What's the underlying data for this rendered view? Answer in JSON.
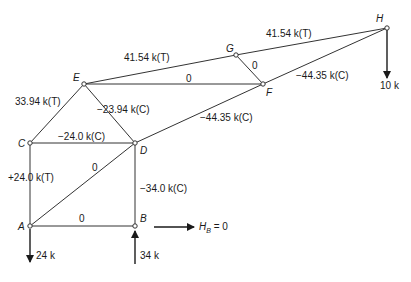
{
  "diagram": {
    "type": "truss-free-body",
    "nodes": {
      "A": {
        "label": "A",
        "x": 30,
        "y": 226
      },
      "B": {
        "label": "B",
        "x": 135,
        "y": 226
      },
      "C": {
        "label": "C",
        "x": 30,
        "y": 143
      },
      "D": {
        "label": "D",
        "x": 135,
        "y": 143
      },
      "E": {
        "label": "E",
        "x": 84,
        "y": 84
      },
      "F": {
        "label": "F",
        "x": 263,
        "y": 84
      },
      "G": {
        "label": "G",
        "x": 236,
        "y": 55
      },
      "H": {
        "label": "H",
        "x": 387,
        "y": 28
      }
    },
    "members": {
      "EG": {
        "force": "41.54 k(T)"
      },
      "GH": {
        "force": "41.54 k(T)"
      },
      "EF": {
        "force": "0"
      },
      "GF": {
        "force": "0"
      },
      "FH": {
        "force": "−44.35 k(C)"
      },
      "DF": {
        "force": "−44.35 k(C)"
      },
      "CE": {
        "force": "33.94 k(T)"
      },
      "ED": {
        "force": "−23.94 k(C)"
      },
      "CD": {
        "force": "−24.0 k(C)"
      },
      "AC": {
        "force": "+24.0 k(T)"
      },
      "AD": {
        "force": "0"
      },
      "BD": {
        "force": "−34.0 k(C)"
      },
      "AB": {
        "force": "0"
      }
    },
    "loads": {
      "H": {
        "label": "10 k",
        "direction": "down"
      },
      "A": {
        "label": "24 k",
        "direction": "down"
      },
      "B": {
        "label": "34 k",
        "direction": "up"
      },
      "horizontal": {
        "label_main": "H",
        "label_sub": "B",
        "label_value": " = 0",
        "direction": "right"
      }
    }
  }
}
